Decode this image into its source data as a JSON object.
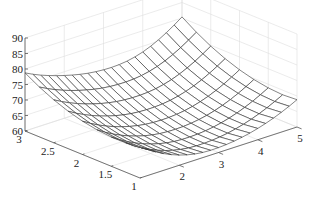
{
  "chart_data": {
    "type": "surface3d",
    "title": "",
    "xlabel": "",
    "ylabel": "",
    "zlabel": "",
    "x_ticks": [
      "2",
      "3",
      "4",
      "5"
    ],
    "x_tick_values": [
      2,
      3,
      4,
      5
    ],
    "y_ticks": [
      "1",
      "1.5",
      "2",
      "2.5",
      "3"
    ],
    "y_tick_values": [
      1,
      1.5,
      2,
      2.5,
      3
    ],
    "z_ticks": [
      "60",
      "65",
      "70",
      "75",
      "80",
      "85",
      "90"
    ],
    "z_tick_values": [
      60,
      65,
      70,
      75,
      80,
      85,
      90
    ],
    "xlim": [
      1,
      5
    ],
    "ylim": [
      1,
      3
    ],
    "zlim": [
      60,
      90
    ],
    "grid": true,
    "legend": null,
    "surface": {
      "style": "mesh",
      "edge_color": "#333333",
      "face_color": "#ffffff",
      "x_samples": 21,
      "y_samples": 9,
      "minimum": {
        "x": 2.8,
        "y": 1.3,
        "z": 61
      },
      "corner_values": {
        "x1_y1": 68,
        "x1_y3": 84,
        "x5_y1": 80,
        "x5_y3": 86
      },
      "description": "Bowl-shaped mesh surface, lowest near x~2.8, y~1.3 (z~61), rising toward edges up to ~86"
    }
  },
  "colors": {
    "background": "#ffffff",
    "axis": "#555555",
    "grid": "#dddddd",
    "mesh": "#333333"
  }
}
